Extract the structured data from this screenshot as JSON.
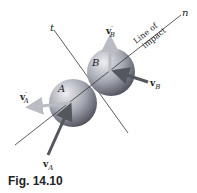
{
  "figure": {
    "caption": "Fig. 14.10",
    "spheres": [
      {
        "label": "A",
        "cx": 73,
        "cy": 103,
        "r": 24
      },
      {
        "label": "B",
        "cx": 111,
        "cy": 72,
        "r": 24
      }
    ],
    "lines": {
      "impact": {
        "label": "n",
        "text_line1": "Line of",
        "text_line2": "impact"
      },
      "tangent": {
        "label": "t"
      }
    },
    "vectors": {
      "vA": {
        "main": "v",
        "sub": "A",
        "prime": ""
      },
      "vA_prime": {
        "main": "v",
        "sub": "A",
        "prime": "′"
      },
      "vB": {
        "main": "v",
        "sub": "B",
        "prime": ""
      },
      "vB_prime": {
        "main": "v",
        "sub": "B",
        "prime": "′"
      }
    },
    "colors": {
      "sphere_light": "#e6e6ea",
      "sphere_dark": "#5c5f6a",
      "arrow_dark": "#55575f",
      "arrow_light": "#b9bcc2",
      "line": "#333333"
    }
  }
}
